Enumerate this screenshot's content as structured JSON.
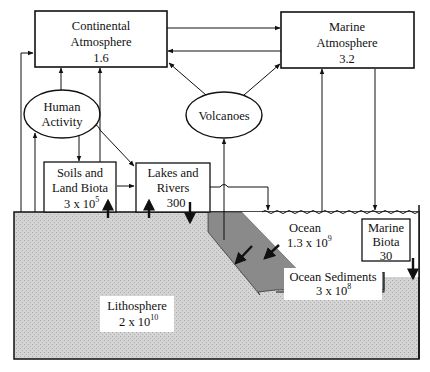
{
  "reservoirs": {
    "continental_atmosphere": {
      "name_line1": "Continental",
      "name_line2": "Atmosphere",
      "value": "1.6"
    },
    "marine_atmosphere": {
      "name_line1": "Marine",
      "name_line2": "Atmosphere",
      "value": "3.2"
    },
    "soils": {
      "name_line1": "Soils  and",
      "name_line2": "Land Biota",
      "value_base": "3 x 10",
      "value_exp": "5"
    },
    "lakes": {
      "name_line1": "Lakes  and",
      "name_line2": "Rivers",
      "value": "300"
    },
    "ocean": {
      "name": "Ocean",
      "value_base": "1.3 x 10",
      "value_exp": "9"
    },
    "marine_biota": {
      "name_line1": "Marine",
      "name_line2": "Biota",
      "value": "30"
    },
    "ocean_sediments": {
      "name": "Ocean  Sediments",
      "value_base": "3 x 10",
      "value_exp": "8"
    },
    "lithosphere": {
      "name": "Lithosphere",
      "value_base": "2 x 10",
      "value_exp": "10"
    }
  },
  "sources": {
    "human_activity": {
      "line1": "Human",
      "line2": "Activity"
    },
    "volcanoes": {
      "label": "Volcanoes"
    }
  },
  "colors": {
    "lithosphere_fill": "#d2d2d2",
    "sediment_fill": "#8a8a8a",
    "line": "#111111",
    "label_bg": "#ffffff"
  }
}
